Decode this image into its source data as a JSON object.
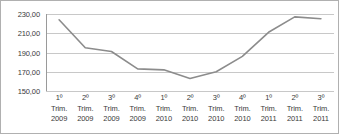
{
  "chart_data": {
    "type": "line",
    "title": "",
    "xlabel": "",
    "ylabel": "",
    "ylim": [
      150,
      230
    ],
    "yticks": [
      150,
      170,
      190,
      210,
      230
    ],
    "ytick_labels": [
      "150,00",
      "170,00",
      "190,00",
      "210,00",
      "230,00"
    ],
    "grid": true,
    "legend": "none",
    "categories": [
      "1º Trim. 2009",
      "2º Trim. 2009",
      "3º Trim. 2009",
      "4º Trim. 2009",
      "1º Trim. 2010",
      "2º Trim. 2010",
      "3º Trim. 2010",
      "4º Trim. 2010",
      "1º Trim. 2011",
      "2º Trim. 2011",
      "3º Trim. 2011"
    ],
    "category_lines": [
      [
        "1º",
        "Trim.",
        "2009"
      ],
      [
        "2º",
        "Trim.",
        "2009"
      ],
      [
        "3º",
        "Trim.",
        "2009"
      ],
      [
        "4º",
        "Trim.",
        "2009"
      ],
      [
        "1º",
        "Trim.",
        "2010"
      ],
      [
        "2º",
        "Trim.",
        "2010"
      ],
      [
        "3º",
        "Trim.",
        "2010"
      ],
      [
        "4º",
        "Trim.",
        "2010"
      ],
      [
        "1º",
        "Trim.",
        "2011"
      ],
      [
        "2º",
        "Trim.",
        "2011"
      ],
      [
        "3º",
        "Trim.",
        "2011"
      ]
    ],
    "values": [
      224,
      195,
      191,
      173,
      172,
      163,
      170,
      186,
      211,
      227,
      225
    ],
    "series": [
      {
        "name": "",
        "color": "#8c8c8c",
        "values": [
          224,
          195,
          191,
          173,
          172,
          163,
          170,
          186,
          211,
          227,
          225
        ]
      }
    ]
  },
  "style": {
    "line_color": "#8c8c8c",
    "grid_color": "#c8c8c8",
    "axis_color": "#9a9a9a",
    "border_color": "#b0b0b0",
    "text_color": "#3a3a3a"
  }
}
